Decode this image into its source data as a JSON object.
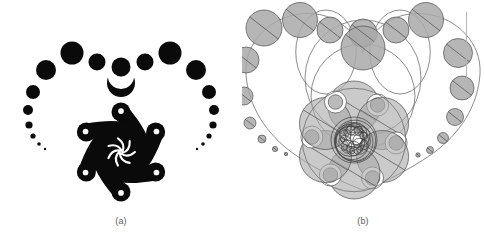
{
  "figure": {
    "background_color": "#ffffff",
    "width": 484,
    "height": 250,
    "panels": [
      {
        "id": "a",
        "caption": "(a)",
        "title": "Heart-shaped spiral ornament (rendered)",
        "style": "solid-black-silhouette",
        "ink_color": "#0a0a0a"
      },
      {
        "id": "b",
        "caption": "(b)",
        "title": "Underlying circle packing construction",
        "style": "gray-outlined-circles",
        "fill_color": "#a9a9a9",
        "stroke_color": "#4f4f4f",
        "curve_color": "#6e6e6e"
      }
    ],
    "rule_mark": {
      "color": "#b5b5b5",
      "orientation": "vertical"
    }
  },
  "chart_data": {
    "type": "scatter",
    "xlabel": "",
    "ylabel": "",
    "grid": false,
    "legend": null,
    "xlim": [
      0,
      242
    ],
    "ylim": [
      0,
      218
    ],
    "series": [
      {
        "name": "panel-a-outer-circle-chain",
        "comment": "Black disks descending in size along the heart outline, panel (a). x,y in panel coords, r = radius px.",
        "points": [
          {
            "x": 121,
            "y": 67,
            "r": 9.5
          },
          {
            "x": 97,
            "y": 62,
            "r": 8.5
          },
          {
            "x": 145,
            "y": 62,
            "r": 8.5
          },
          {
            "x": 72,
            "y": 53,
            "r": 11.5
          },
          {
            "x": 170,
            "y": 53,
            "r": 11.5
          },
          {
            "x": 46,
            "y": 70,
            "r": 10.0
          },
          {
            "x": 196,
            "y": 70,
            "r": 10.0
          },
          {
            "x": 33,
            "y": 92,
            "r": 7.0
          },
          {
            "x": 209,
            "y": 92,
            "r": 7.0
          },
          {
            "x": 28,
            "y": 110,
            "r": 5.0
          },
          {
            "x": 214,
            "y": 110,
            "r": 5.0
          },
          {
            "x": 29,
            "y": 125,
            "r": 3.6
          },
          {
            "x": 213,
            "y": 125,
            "r": 3.6
          },
          {
            "x": 33,
            "y": 136,
            "r": 2.6
          },
          {
            "x": 209,
            "y": 136,
            "r": 2.6
          },
          {
            "x": 39,
            "y": 144,
            "r": 1.8
          },
          {
            "x": 203,
            "y": 144,
            "r": 1.8
          },
          {
            "x": 45,
            "y": 149,
            "r": 1.2
          },
          {
            "x": 197,
            "y": 149,
            "r": 1.2
          }
        ]
      },
      {
        "name": "panel-a-crescent-top",
        "comment": "Crescent (lune) with dot above, at heart cleft",
        "points": [
          {
            "x": 121,
            "y": 83,
            "r": 14.0
          }
        ]
      },
      {
        "name": "panel-a-spiral-arms",
        "comment": "Six comma/tadpole swirl arms forming the central rosette",
        "count": 6,
        "center": {
          "x": 121,
          "y": 152
        },
        "radius": 40,
        "head_radius": 9.5
      },
      {
        "name": "panel-a-core-rosette",
        "comment": "Tiny 7-arm spiral at the exact center",
        "center": {
          "x": 121,
          "y": 152
        },
        "radius": 15,
        "arms": 7
      },
      {
        "name": "panel-b-outer-circle-chain",
        "comment": "Gray filled circles on the heart curve, panel (b)",
        "points": [
          {
            "x": 121,
            "y": 33,
            "r": 14.0
          },
          {
            "x": 121,
            "y": 48,
            "r": 22.0
          },
          {
            "x": 88,
            "y": 30,
            "r": 13.0
          },
          {
            "x": 154,
            "y": 30,
            "r": 13.0
          },
          {
            "x": 58,
            "y": 20,
            "r": 17.5
          },
          {
            "x": 184,
            "y": 20,
            "r": 17.5
          },
          {
            "x": 22,
            "y": 28,
            "r": 18.0
          },
          {
            "x": 216,
            "y": 53,
            "r": 14.5
          },
          {
            "x": 4,
            "y": 60,
            "r": 13.0
          },
          {
            "x": 220,
            "y": 88,
            "r": 12.0
          },
          {
            "x": 2,
            "y": 96,
            "r": 9.0
          },
          {
            "x": 213,
            "y": 117,
            "r": 8.5
          },
          {
            "x": 8,
            "y": 123,
            "r": 6.0
          },
          {
            "x": 201,
            "y": 138,
            "r": 5.5
          },
          {
            "x": 20,
            "y": 139,
            "r": 4.0
          },
          {
            "x": 188,
            "y": 150,
            "r": 3.5
          },
          {
            "x": 33,
            "y": 149,
            "r": 2.6
          },
          {
            "x": 176,
            "y": 155,
            "r": 2.2
          },
          {
            "x": 44,
            "y": 154,
            "r": 1.7
          }
        ]
      },
      {
        "name": "panel-b-core-cluster",
        "comment": "Six large gray circles ringing the center, each paired with an annulus",
        "count": 6,
        "center": {
          "x": 112,
          "y": 140
        },
        "ring_radius": 33,
        "circle_radius": 26,
        "annulus_radius": 11
      },
      {
        "name": "panel-b-center-spiral",
        "comment": "Nested shrinking circle spiral at the core",
        "center": {
          "x": 112,
          "y": 140
        },
        "start_radius": 23,
        "turns": 3
      }
    ]
  }
}
